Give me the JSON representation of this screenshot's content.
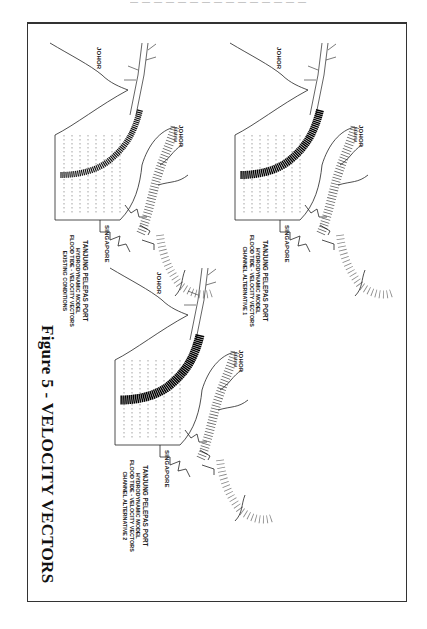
{
  "page": {
    "running_head": "— — — — — — — — — — — — — — —"
  },
  "figure": {
    "caption": "Figure 5 - VELOCITY VECTORS",
    "orientation": "rotated 90° (landscape on portrait page)",
    "panels": [
      {
        "id": "existing",
        "title_lines": [
          "TANJUNG PELEPAS PORT",
          "HYDRODYNAMIC MODEL",
          "FLOOD TIDE - VELOCITY VECTORS",
          "EXISTING CONDITIONS"
        ],
        "labels": {
          "johor_west": "JOHOR",
          "johor_north": "JOHOR",
          "johor_north_sub": "MALAYSIA",
          "singapore": "SINGAPORE"
        }
      },
      {
        "id": "alternative-1",
        "title_lines": [
          "TANJUNG PELEPAS PORT",
          "HYDRODYNAMIC MODEL",
          "FLOOD TIDE - VELOCITY VECTORS",
          "CHANNEL ALTERNATIVE 1"
        ],
        "labels": {
          "johor_west": "JOHOR",
          "johor_north": "JOHOR",
          "johor_north_sub": "MALAYSIA",
          "singapore": "SINGAPORE"
        }
      },
      {
        "id": "alternative-2",
        "title_lines": [
          "TANJUNG PELEPAS PORT",
          "HYDRODYNAMIC MODEL",
          "FLOOD TIDE - VELOCITY VECTORS",
          "CHANNEL ALTERNATIVE 2"
        ],
        "labels": {
          "johor_west": "JOHOR",
          "johor_north": "JOHOR",
          "johor_north_sub": "MALAYSIA",
          "singapore": "SINGAPORE"
        }
      }
    ]
  }
}
